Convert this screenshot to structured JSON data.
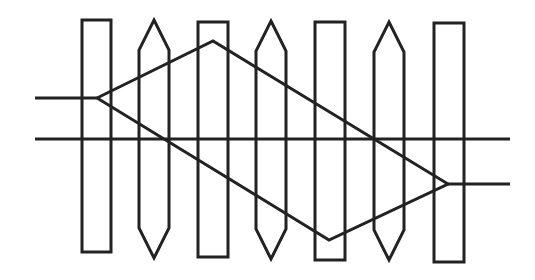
{
  "diagram": {
    "title": "",
    "stroke_color": "#222222",
    "background": "#ffffff",
    "bars": [
      {
        "type": "rect",
        "x": 82,
        "y": 20,
        "w": 29,
        "h": 232
      },
      {
        "type": "pointed",
        "x": 139,
        "w": 30,
        "tip_top": 20,
        "shoulder_top": 50,
        "shoulder_bottom": 228,
        "tip_bottom": 258
      },
      {
        "type": "rect",
        "x": 198,
        "y": 22,
        "w": 30,
        "h": 235
      },
      {
        "type": "pointed",
        "x": 256,
        "w": 30,
        "tip_top": 21,
        "shoulder_top": 51,
        "shoulder_bottom": 229,
        "tip_bottom": 259
      },
      {
        "type": "rect",
        "x": 315,
        "y": 22,
        "w": 30,
        "h": 238
      },
      {
        "type": "pointed",
        "x": 374,
        "w": 30,
        "tip_top": 22,
        "shoulder_top": 52,
        "shoulder_bottom": 230,
        "tip_bottom": 260
      },
      {
        "type": "rect",
        "x": 434,
        "y": 23,
        "w": 30,
        "h": 239
      }
    ],
    "lines": [
      {
        "name": "left-input-line",
        "x1": 35,
        "y1": 98,
        "x2": 97,
        "y2": 98
      },
      {
        "name": "middle-through-line",
        "x1": 35,
        "y1": 139,
        "x2": 510,
        "y2": 139
      },
      {
        "name": "right-output-line",
        "x1": 448,
        "y1": 184,
        "x2": 510,
        "y2": 184
      }
    ],
    "diamond": {
      "points": "97,98 213,41 448,184 329,240",
      "lower_path": "97,98 200,148 233,163 329,240"
    }
  }
}
